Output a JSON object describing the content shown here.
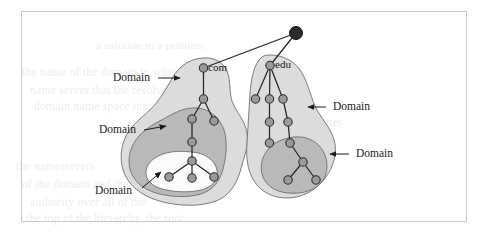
{
  "figure": {
    "kind": "dns-domain-hierarchy-diagram",
    "frame": {
      "x": 21,
      "y": 11,
      "width": 446,
      "height": 211,
      "border_color": "#c8c8c8"
    },
    "background_color": "#ffffff"
  },
  "palette": {
    "ink": "#1a1a1a",
    "node_fill": "#9a9a9a",
    "node_stroke": "#2b2b2b",
    "root_fill": "#2b2b2b",
    "blob_outer": "#dcdcdc",
    "blob_mid": "#b9b9b9",
    "blob_inner_white": "#fbfbfb",
    "blob_stroke": "#6e6e6e",
    "edge": "#262626"
  },
  "nodes": {
    "root": {
      "name": "root-node",
      "label": "",
      "cx": 296,
      "cy": 33,
      "r": 6.5,
      "filled": true
    },
    "com": {
      "name": "com-node",
      "label": "com",
      "cx": 203.5,
      "cy": 68,
      "r": 4.2
    },
    "edu": {
      "name": "edu-node",
      "label": "edu",
      "cx": 270,
      "cy": 65.5,
      "r": 4.2
    }
  },
  "labels": {
    "tld": [
      {
        "text": "com",
        "x": 208,
        "y": 62
      },
      {
        "text": "edu",
        "x": 275,
        "y": 59
      }
    ],
    "domains": [
      {
        "id": "domain-top-left",
        "text": "Domain",
        "x": 117,
        "y": 81
      },
      {
        "id": "domain-mid-left",
        "text": "Domain",
        "x": 103,
        "y": 131
      },
      {
        "id": "domain-bottom-left",
        "text": "Domain",
        "x": 99,
        "y": 192
      },
      {
        "id": "domain-top-right",
        "text": "Domain",
        "x": 329,
        "y": 110
      },
      {
        "id": "domain-bottom-right",
        "text": "Domain",
        "x": 352,
        "y": 157
      }
    ]
  },
  "chart_data": {
    "type": "diagram",
    "title": "",
    "tree_edges": [
      [
        "root",
        "com"
      ],
      [
        "root",
        "edu"
      ],
      [
        "com",
        "c1"
      ],
      [
        "c1",
        "c2"
      ],
      [
        "c1",
        "c3"
      ],
      [
        "c2",
        "c4"
      ],
      [
        "c4",
        "c5"
      ],
      [
        "c5",
        "c6"
      ],
      [
        "c5",
        "c7"
      ],
      [
        "c5",
        "c8"
      ],
      [
        "edu",
        "e1"
      ],
      [
        "edu",
        "e2"
      ],
      [
        "edu",
        "e3"
      ],
      [
        "e2",
        "e4"
      ],
      [
        "e3",
        "e5"
      ],
      [
        "e4",
        "e6"
      ],
      [
        "e5",
        "e7"
      ],
      [
        "e7",
        "e8"
      ],
      [
        "e8",
        "e9"
      ],
      [
        "e8",
        "e10"
      ]
    ],
    "node_positions": {
      "root": [
        296,
        33
      ],
      "com": [
        203.5,
        68
      ],
      "c1": [
        203.5,
        99
      ],
      "c2": [
        192,
        119
      ],
      "c3": [
        214,
        121
      ],
      "c4": [
        192,
        142
      ],
      "c5": [
        192,
        161
      ],
      "c6": [
        169,
        177
      ],
      "c7": [
        192,
        178
      ],
      "c8": [
        214,
        177
      ],
      "edu": [
        270,
        65.5
      ],
      "e1": [
        255.5,
        99
      ],
      "e2": [
        269.5,
        99
      ],
      "e3": [
        283,
        99
      ],
      "e4": [
        269.5,
        122
      ],
      "e5": [
        288,
        122
      ],
      "e6": [
        269.5,
        143
      ],
      "e7": [
        290,
        143
      ],
      "e8": [
        303,
        162
      ],
      "e9": [
        288,
        180
      ],
      "e10": [
        316,
        180
      ]
    },
    "domain_regions": [
      {
        "name": "com-outer-domain",
        "shade": "light",
        "label": "Domain"
      },
      {
        "name": "com-middle-domain",
        "shade": "dark",
        "label": "Domain"
      },
      {
        "name": "com-inner-domain",
        "shade": "white",
        "label": "Domain"
      },
      {
        "name": "edu-outer-domain",
        "shade": "light",
        "label": "Domain"
      },
      {
        "name": "edu-inner-domain",
        "shade": "dark",
        "label": "Domain"
      }
    ],
    "legend": [],
    "grid": false
  },
  "ghost_text": [
    {
      "text": "a solution to a problem",
      "x": 96,
      "y": 39,
      "size": 11
    },
    {
      "text": "the name of the domain in which the",
      "x": 22,
      "y": 66,
      "size": 11.5
    },
    {
      "text": "name server that the resolver",
      "x": 30,
      "y": 84,
      "size": 11.5
    },
    {
      "text": "domain name space into",
      "x": 34,
      "y": 100,
      "size": 11.5
    },
    {
      "text": "each of the zones",
      "x": 258,
      "y": 116,
      "size": 11.5
    },
    {
      "text": "the nameservers",
      "x": 16,
      "y": 160,
      "size": 11.5
    },
    {
      "text": "of the domain and the",
      "x": 22,
      "y": 178,
      "size": 11.5
    },
    {
      "text": "authority over all of the",
      "x": 30,
      "y": 196,
      "size": 11.5
    },
    {
      "text": "the top of the hierarchy, the root",
      "x": 26,
      "y": 212,
      "size": 11.5
    }
  ]
}
